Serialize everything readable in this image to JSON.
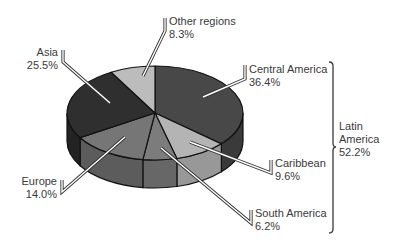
{
  "chart_data": {
    "type": "pie",
    "style": "3d-pie",
    "title": "",
    "slices": [
      {
        "label": "Central America",
        "value": 36.4,
        "display": "36.4%",
        "color": "#484848",
        "side": "#3a3a3a"
      },
      {
        "label": "Caribbean",
        "value": 9.6,
        "display": "9.6%",
        "color": "#b4b4b4",
        "side": "#989898"
      },
      {
        "label": "South America",
        "value": 6.2,
        "display": "6.2%",
        "color": "#7c7c7c",
        "side": "#676767"
      },
      {
        "label": "Europe",
        "value": 14.0,
        "display": "14.0%",
        "color": "#767676",
        "side": "#5c5c5c"
      },
      {
        "label": "Asia",
        "value": 25.5,
        "display": "25.5%",
        "color": "#2f2f2f",
        "side": "#232323"
      },
      {
        "label": "Other regions",
        "value": 8.3,
        "display": "8.3%",
        "color": "#bcbcbc",
        "side": "#a0a0a0"
      }
    ],
    "groups": [
      {
        "label": "Latin America",
        "value": 52.2,
        "display": "52.2%",
        "members": [
          "Central America",
          "Caribbean",
          "South America"
        ]
      }
    ],
    "start_angle_deg": 0,
    "direction": "clockwise",
    "legend": "none (leader-line labels)"
  },
  "labels": {
    "other": {
      "name": "Other regions",
      "pct": "8.3%"
    },
    "asia": {
      "name": "Asia",
      "pct": "25.5%"
    },
    "central": {
      "name": "Central America",
      "pct": "36.4%"
    },
    "latin_line1": "Latin",
    "latin_line2": "America",
    "latin_pct": "52.2%",
    "caribbean": {
      "name": "Caribbean",
      "pct": "9.6%"
    },
    "south": {
      "name": "South America",
      "pct": "6.2%"
    },
    "europe": {
      "name": "Europe",
      "pct": "14.0%"
    }
  }
}
